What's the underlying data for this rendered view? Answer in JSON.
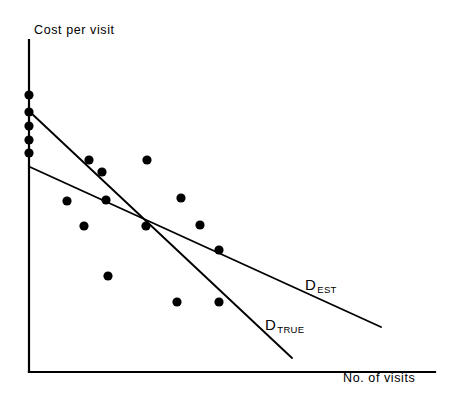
{
  "figure": {
    "title": "",
    "background_color": "#ffffff",
    "ink_color": "#000000"
  },
  "chart_data": {
    "type": "scatter",
    "title": "",
    "subtitle": "",
    "xlabel": "No. of visits",
    "ylabel": "Cost per visit",
    "grid": false,
    "legend_position": "inline-at-line-end",
    "axis_ticks": {
      "x": [],
      "y": []
    },
    "axis_ranges": {
      "x": [
        0,
        100
      ],
      "y": [
        0,
        100
      ]
    },
    "points": {
      "name": "Observations",
      "marker": "filled-circle",
      "marker_radius_px": 4.6,
      "color": "#000000",
      "count": 17,
      "pixel_coords": [
        [
          29,
          95
        ],
        [
          29,
          112
        ],
        [
          29,
          126
        ],
        [
          29,
          140
        ],
        [
          29,
          153
        ],
        [
          89,
          160
        ],
        [
          102,
          172
        ],
        [
          147,
          160
        ],
        [
          67,
          201
        ],
        [
          106,
          200
        ],
        [
          181,
          198
        ],
        [
          84,
          226
        ],
        [
          146,
          226
        ],
        [
          200,
          225
        ],
        [
          219,
          250
        ],
        [
          108,
          276
        ],
        [
          177,
          302
        ],
        [
          219,
          302
        ]
      ]
    },
    "series": [
      {
        "name": "D_TRUE",
        "label_main": "D",
        "label_sub": "TRUE",
        "type": "line",
        "color": "#000000",
        "start_px": [
          30,
          112
        ],
        "end_px": [
          292,
          358
        ],
        "label_px": [
          265,
          330
        ],
        "description": "Steeper fitted line, the true demand relationship"
      },
      {
        "name": "D_EST",
        "label_main": "D",
        "label_sub": "EST",
        "type": "line",
        "color": "#000000",
        "start_px": [
          30,
          167
        ],
        "end_px": [
          381,
          327
        ],
        "label_px": [
          305,
          290
        ],
        "description": "Flatter fitted line, the estimated demand relationship"
      }
    ],
    "intersection_px": [
      152,
      227
    ],
    "axes_geometry": {
      "origin_px": [
        29,
        372
      ],
      "y_axis_top_px": [
        29,
        40
      ],
      "x_axis_right_px": [
        435,
        372
      ]
    }
  },
  "labels": {
    "y_axis": {
      "text": "Cost per visit",
      "px": [
        34,
        34
      ]
    },
    "x_axis": {
      "text": "No. of visits",
      "px": [
        343,
        382
      ]
    }
  }
}
